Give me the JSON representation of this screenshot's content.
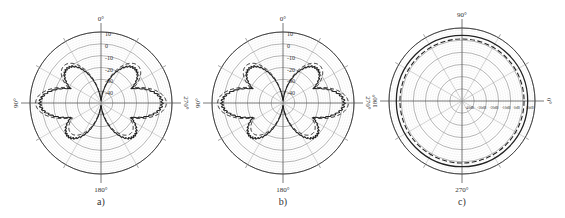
{
  "chart_data": [
    {
      "type": "polar-line",
      "panel_label": "a)",
      "center": [
        101,
        103
      ],
      "radius": 71,
      "angle_labels": {
        "top": "0°",
        "left": "90°",
        "right": "270°",
        "bottom": "180°"
      },
      "radial_ticks": [
        "10",
        "0",
        "-10",
        "-20",
        "-30",
        "-40"
      ],
      "rlim": [
        -50,
        10
      ],
      "unit": "dB",
      "series": [
        {
          "name": "measured",
          "style": "solid",
          "shape": "butterfly",
          "side_lobe_r": 0.86,
          "upper_lobe_r": 0.68,
          "lower_lobe_r": 0.66
        },
        {
          "name": "simulated",
          "style": "dashed",
          "shape": "butterfly",
          "side_lobe_r": 0.92,
          "upper_lobe_r": 0.74,
          "lower_lobe_r": 0.6
        }
      ]
    },
    {
      "type": "polar-line",
      "panel_label": "b)",
      "center": [
        283,
        103
      ],
      "radius": 71,
      "angle_labels": {
        "top": "0°",
        "left": "90°",
        "right": "270°",
        "bottom": "180°"
      },
      "radial_ticks": [
        "10",
        "0",
        "-10",
        "-20",
        "-30",
        "-40"
      ],
      "rlim": [
        -50,
        10
      ],
      "unit": "dB",
      "series": [
        {
          "name": "measured",
          "style": "solid",
          "shape": "butterfly",
          "side_lobe_r": 0.86,
          "upper_lobe_r": 0.68,
          "lower_lobe_r": 0.66
        },
        {
          "name": "simulated",
          "style": "dashed",
          "shape": "butterfly",
          "side_lobe_r": 0.92,
          "upper_lobe_r": 0.74,
          "lower_lobe_r": 0.6
        }
      ]
    },
    {
      "type": "polar-line",
      "panel_label": "c)",
      "center": [
        462,
        101
      ],
      "radius": 73,
      "angle_labels": {
        "top": "90°",
        "left": "180°",
        "right": "0°",
        "bottom": "270°"
      },
      "radial_ticks": [
        "-40dB",
        "-30dB",
        "-20dB",
        "-10dB",
        "0dB",
        "10dB"
      ],
      "rlim": [
        -50,
        10
      ],
      "unit": "dB",
      "series": [
        {
          "name": "measured",
          "style": "solid",
          "shape": "circle",
          "r": 0.9
        },
        {
          "name": "simulated",
          "style": "dashed",
          "shape": "circle",
          "r": 0.85
        }
      ]
    }
  ]
}
